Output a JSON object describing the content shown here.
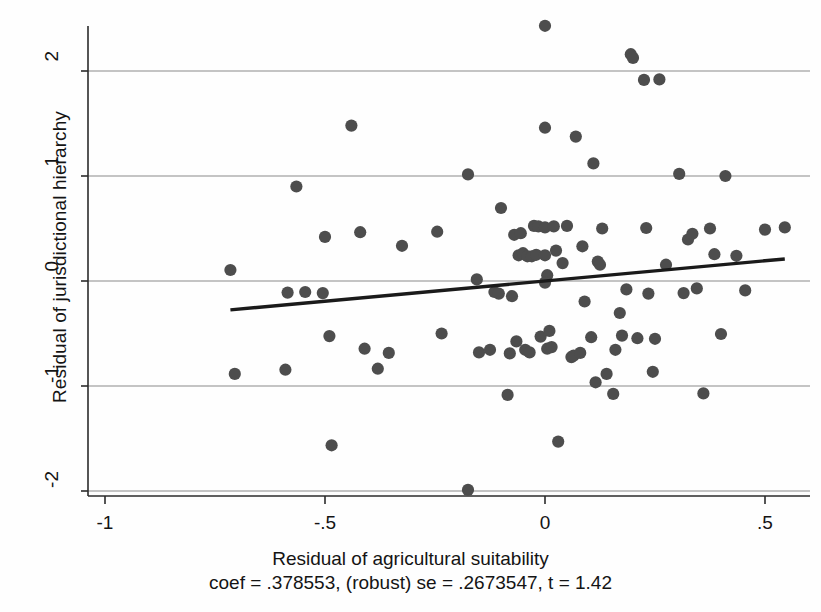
{
  "chart_data": {
    "type": "scatter",
    "title": "",
    "xlabel": "Residual of agricultural suitability",
    "ylabel": "Residual of jurisdictional hierarchy",
    "xlim": [
      -1.06,
      0.56
    ],
    "ylim": [
      -2.22,
      2.62
    ],
    "xticks": [
      -1,
      -0.5,
      0,
      0.5
    ],
    "xticklabels": [
      "-1",
      "-.5",
      "0",
      ".5"
    ],
    "yticks": [
      -2,
      -1,
      0,
      1,
      2
    ],
    "yticklabels": [
      "-2",
      "-1",
      "0",
      "1",
      "2"
    ],
    "grid": "horizontal-at-yticks",
    "legend": "none",
    "marker_color": "#4d4d4d",
    "line_color": "#1a1a1a",
    "annotation": "coef = .378553, (robust) se = .2673547, t = 1.42",
    "fit_line": {
      "label": "linear fit",
      "x": [
        -0.715,
        0.545
      ],
      "y": [
        -0.275,
        0.21
      ],
      "slope": 0.378553,
      "intercept": 0.0
    },
    "stats": {
      "coef": ".378553",
      "se": ".2673547",
      "t": "1.42",
      "se_type": "robust"
    },
    "points": [
      [
        -0.715,
        0.105
      ],
      [
        -0.705,
        -0.885
      ],
      [
        -0.585,
        -0.11
      ],
      [
        -0.59,
        -0.845
      ],
      [
        -0.565,
        0.9
      ],
      [
        -0.545,
        -0.105
      ],
      [
        -0.5,
        0.42
      ],
      [
        -0.505,
        -0.115
      ],
      [
        -0.49,
        -0.525
      ],
      [
        -0.485,
        -1.565
      ],
      [
        -0.44,
        1.48
      ],
      [
        -0.42,
        0.465
      ],
      [
        -0.41,
        -0.645
      ],
      [
        -0.38,
        -0.835
      ],
      [
        -0.355,
        -0.685
      ],
      [
        -0.325,
        0.335
      ],
      [
        -0.245,
        0.47
      ],
      [
        -0.235,
        -0.5
      ],
      [
        -0.175,
        1.015
      ],
      [
        -0.175,
        -1.99
      ],
      [
        -0.155,
        0.015
      ],
      [
        -0.15,
        -0.68
      ],
      [
        -0.125,
        -0.655
      ],
      [
        -0.115,
        -0.105
      ],
      [
        -0.105,
        -0.12
      ],
      [
        -0.1,
        0.695
      ],
      [
        -0.085,
        -1.085
      ],
      [
        -0.08,
        -0.69
      ],
      [
        -0.075,
        -0.145
      ],
      [
        -0.07,
        0.44
      ],
      [
        -0.065,
        -0.575
      ],
      [
        -0.06,
        0.245
      ],
      [
        -0.055,
        0.455
      ],
      [
        -0.05,
        0.265
      ],
      [
        -0.045,
        -0.655
      ],
      [
        -0.04,
        0.235
      ],
      [
        -0.035,
        -0.68
      ],
      [
        -0.03,
        0.235
      ],
      [
        -0.025,
        0.525
      ],
      [
        -0.02,
        0.25
      ],
      [
        -0.015,
        0.52
      ],
      [
        -0.01,
        -0.53
      ],
      [
        0.0,
        2.43
      ],
      [
        0.0,
        1.46
      ],
      [
        0.0,
        0.51
      ],
      [
        0.0,
        0.245
      ],
      [
        0.005,
        0.055
      ],
      [
        0.0,
        -0.015
      ],
      [
        0.005,
        -0.645
      ],
      [
        0.01,
        -0.475
      ],
      [
        0.015,
        -0.63
      ],
      [
        0.02,
        0.52
      ],
      [
        0.025,
        0.29
      ],
      [
        0.03,
        -1.53
      ],
      [
        0.04,
        0.17
      ],
      [
        0.05,
        0.525
      ],
      [
        0.06,
        -0.725
      ],
      [
        0.065,
        -0.71
      ],
      [
        0.07,
        1.375
      ],
      [
        0.08,
        -0.685
      ],
      [
        0.085,
        0.33
      ],
      [
        0.09,
        -0.195
      ],
      [
        0.105,
        -0.535
      ],
      [
        0.11,
        1.12
      ],
      [
        0.115,
        -0.965
      ],
      [
        0.12,
        0.185
      ],
      [
        0.125,
        0.155
      ],
      [
        0.13,
        0.5
      ],
      [
        0.14,
        -0.885
      ],
      [
        0.155,
        -1.075
      ],
      [
        0.16,
        -0.655
      ],
      [
        0.17,
        -0.305
      ],
      [
        0.175,
        -0.52
      ],
      [
        0.185,
        -0.08
      ],
      [
        0.195,
        2.16
      ],
      [
        0.2,
        2.125
      ],
      [
        0.21,
        -0.545
      ],
      [
        0.225,
        1.915
      ],
      [
        0.23,
        0.505
      ],
      [
        0.235,
        -0.12
      ],
      [
        0.245,
        -0.865
      ],
      [
        0.25,
        -0.55
      ],
      [
        0.26,
        1.92
      ],
      [
        0.275,
        0.155
      ],
      [
        0.305,
        1.02
      ],
      [
        0.315,
        -0.115
      ],
      [
        0.325,
        0.395
      ],
      [
        0.335,
        0.45
      ],
      [
        0.345,
        -0.07
      ],
      [
        0.36,
        -1.07
      ],
      [
        0.375,
        0.5
      ],
      [
        0.385,
        0.255
      ],
      [
        0.4,
        -0.505
      ],
      [
        0.41,
        1.0
      ],
      [
        0.435,
        0.24
      ],
      [
        0.455,
        -0.09
      ],
      [
        0.5,
        0.49
      ],
      [
        0.545,
        0.51
      ]
    ]
  }
}
